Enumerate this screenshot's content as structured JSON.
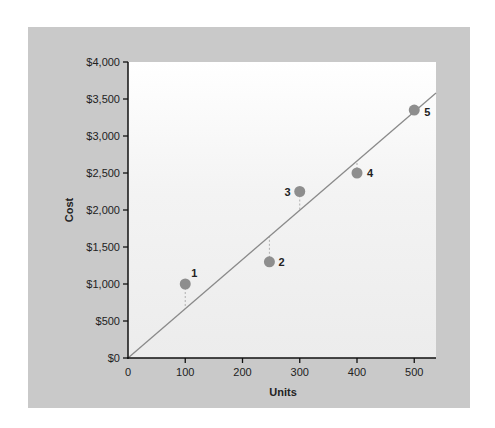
{
  "chart_data": {
    "type": "scatter",
    "title": "",
    "xlabel": "Units",
    "ylabel": "Cost",
    "xlim": [
      0,
      538
    ],
    "ylim": [
      0,
      4000
    ],
    "x_ticks": [
      0,
      100,
      200,
      300,
      400,
      500
    ],
    "x_tick_labels": [
      "0",
      "100",
      "200",
      "300",
      "400",
      "500"
    ],
    "y_ticks": [
      0,
      500,
      1000,
      1500,
      2000,
      2500,
      3000,
      3500,
      4000
    ],
    "y_tick_labels": [
      "$0",
      "$500",
      "$1,000",
      "$1,500",
      "$2,000",
      "$2,500",
      "$3,000",
      "$3,500",
      "$4,000"
    ],
    "grid": false,
    "legend": null,
    "points": [
      {
        "label": "1",
        "x": 100,
        "y": 1000
      },
      {
        "label": "2",
        "x": 247,
        "y": 1300
      },
      {
        "label": "3",
        "x": 300,
        "y": 2250
      },
      {
        "label": "4",
        "x": 400,
        "y": 2500
      },
      {
        "label": "5",
        "x": 500,
        "y": 3350
      }
    ],
    "trend_line": {
      "x0": 0,
      "y0": 0,
      "x1": 538,
      "y1": 3580,
      "slope": 6.65
    },
    "residual_lines": "dashed vertical lines from each point to the trend line",
    "colors": {
      "panel": "#c9c9c9",
      "plot_bg": "#f4f4f4",
      "point": "#8e8e8e",
      "line": "#8a8a8a",
      "residual": "#b0b0b0",
      "axis": "#111111"
    }
  }
}
